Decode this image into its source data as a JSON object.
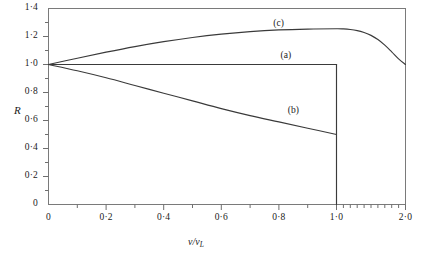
{
  "chart_data": {
    "type": "line",
    "title": "",
    "xlabel": "v/vL",
    "ylabel": "R",
    "xlim": [
      0,
      2.0
    ],
    "ylim": [
      0,
      1.4
    ],
    "grid": false,
    "legend_position": "inline-annotations",
    "x_ticks_major": [
      "0",
      "0·2",
      "0·4",
      "0·6",
      "0·8",
      "1·0",
      "2·0"
    ],
    "x_tick_values": [
      0,
      0.2,
      0.4,
      0.6,
      0.8,
      1.0,
      2.0
    ],
    "y_ticks_major": [
      "0",
      "0·2",
      "0·4",
      "0·6",
      "0·8",
      "1·0",
      "1·2",
      "1·4"
    ],
    "y_tick_values": [
      0,
      0.2,
      0.4,
      0.6,
      0.8,
      1.0,
      1.2,
      1.4
    ],
    "x_axis_note": "piecewise scale: 0 to 1.0 occupies most of the width, 1.0 to 2.0 is compressed into the remaining right portion",
    "series": [
      {
        "name": "(a)",
        "label": "(a)",
        "label_x": 0.83,
        "label_y": 1.055,
        "x": [
          0,
          0.1,
          0.2,
          0.3,
          0.4,
          0.5,
          0.6,
          0.7,
          0.8,
          0.9,
          1.0,
          1.0
        ],
        "values": [
          1.0,
          1.0,
          1.0,
          1.0,
          1.0,
          1.0,
          1.0,
          1.0,
          1.0,
          1.0,
          1.0,
          0.0
        ]
      },
      {
        "name": "(b)",
        "label": "(b)",
        "label_x": 0.855,
        "label_y": 0.66,
        "x": [
          0,
          0.1,
          0.2,
          0.3,
          0.4,
          0.5,
          0.6,
          0.7,
          0.8,
          0.9,
          1.0
        ],
        "values": [
          1.0,
          0.955,
          0.905,
          0.85,
          0.795,
          0.74,
          0.685,
          0.635,
          0.59,
          0.545,
          0.5
        ]
      },
      {
        "name": "(c)",
        "label": "(c)",
        "label_x": 0.805,
        "label_y": 1.285,
        "x": [
          0,
          0.1,
          0.2,
          0.3,
          0.4,
          0.5,
          0.6,
          0.7,
          0.8,
          0.9,
          1.0,
          1.1,
          1.2,
          1.3,
          1.4,
          1.5,
          1.6,
          1.7,
          1.8,
          1.9,
          2.0
        ],
        "values": [
          1.0,
          1.045,
          1.088,
          1.128,
          1.163,
          1.193,
          1.217,
          1.235,
          1.247,
          1.253,
          1.255,
          1.254,
          1.25,
          1.242,
          1.228,
          1.208,
          1.178,
          1.138,
          1.09,
          1.04,
          1.0
        ]
      }
    ],
    "vertical_drop": {
      "name": "drop-line-at-1",
      "x": 1.0,
      "y_from": 1.0,
      "y_to": 0.0
    }
  }
}
